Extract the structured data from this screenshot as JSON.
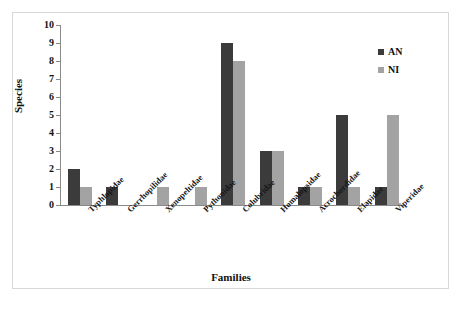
{
  "chart_data": {
    "type": "bar",
    "title": "",
    "xlabel": "Families",
    "ylabel": "Species",
    "ylim": [
      0,
      10
    ],
    "yticks": [
      0,
      1,
      2,
      3,
      4,
      5,
      6,
      7,
      8,
      9,
      10
    ],
    "grid": false,
    "legend_position": "top-right",
    "categories": [
      "Typhlopidae",
      "Gerrhopilidae",
      "Xenopeltidae",
      "Pythonidae",
      "Colubridae",
      "Homalopsidae",
      "Acrochordidae",
      "Elapidae",
      "Viperidae"
    ],
    "series": [
      {
        "name": "AN",
        "color": "#3b3b3b",
        "values": [
          2,
          1,
          0,
          0,
          9,
          3,
          1,
          5,
          1
        ]
      },
      {
        "name": "NI",
        "color": "#a3a3a3",
        "values": [
          1,
          0,
          1,
          1,
          8,
          3,
          1,
          1,
          5
        ]
      }
    ]
  },
  "legend": {
    "items": [
      {
        "label": "AN",
        "color": "#3b3b3b"
      },
      {
        "label": "NI",
        "color": "#a3a3a3"
      }
    ]
  },
  "axes": {
    "y_title": "Species",
    "x_title": "Families"
  }
}
